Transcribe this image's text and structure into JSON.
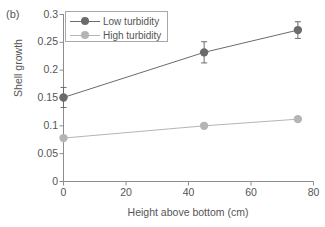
{
  "panel": {
    "label": "(b)"
  },
  "chart_data": {
    "type": "line",
    "title": "",
    "subtitle": "",
    "xlabel": "Height above bottom (cm)",
    "ylabel": "Shell growth",
    "xlim": [
      0,
      80
    ],
    "ylim": [
      0,
      0.3
    ],
    "xticks": [
      "0",
      "20",
      "40",
      "60",
      "80"
    ],
    "xtick_values": [
      0,
      20,
      40,
      60,
      80
    ],
    "yticks": [
      "0",
      "0.05",
      "0.1",
      "0.15",
      "0.2",
      "0.25",
      "0.3"
    ],
    "ytick_values": [
      0,
      0.05,
      0.1,
      0.15,
      0.2,
      0.25,
      0.3
    ],
    "grid": false,
    "legend_position": "top-left",
    "x": [
      0,
      45,
      75
    ],
    "series": [
      {
        "name": "Low turbidity",
        "color": "#6b6b6b",
        "values": [
          0.151,
          0.232,
          0.272
        ],
        "error": [
          0.018,
          0.019,
          0.015
        ],
        "has_error_bars": true
      },
      {
        "name": "High turbidity",
        "color": "#b5b5b5",
        "values": [
          0.078,
          0.1,
          0.112
        ],
        "error": [
          0.0,
          0.0,
          0.0
        ],
        "has_error_bars": false
      }
    ]
  },
  "colors": {
    "axis": "#8c8c8c",
    "text": "#555555",
    "low_turbidity": "#6b6b6b",
    "high_turbidity": "#b5b5b5",
    "legend_border": "#a8a8a8",
    "background": "#ffffff"
  }
}
